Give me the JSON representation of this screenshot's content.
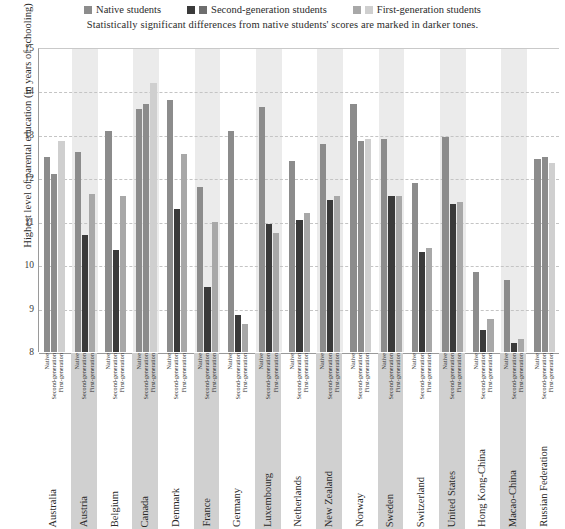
{
  "legend": {
    "items": [
      {
        "label": "Native students",
        "swatches": [
          "#8c8c8c"
        ]
      },
      {
        "label": "Second-generation students",
        "swatches": [
          "#3a3a3a",
          "#6e6e6e"
        ]
      },
      {
        "label": "First-generation students",
        "swatches": [
          "#a8a8a8",
          "#cfcfcf"
        ]
      }
    ]
  },
  "subtitle": "Statistically significant differences from native students' scores are marked in darker tones.",
  "colors": {
    "native": "#8c8c8c",
    "second_sig": "#3a3a3a",
    "second_nonsig": "#8c8c8c",
    "first_sig": "#a8a8a8",
    "first_nonsig": "#cfcfcf",
    "band": "#ebebeb",
    "label_band": "#d0d0d0",
    "grid": "#c4c4c4",
    "axis": "#9a9a9a"
  },
  "chart_data": {
    "type": "bar",
    "title": "",
    "subtitle": "Statistically significant differences from native students' scores are marked in darker tones.",
    "xlabel": "",
    "ylabel": "Highest level of parental education (in years of schooling)",
    "ylim": [
      8,
      15
    ],
    "yticks": [
      8,
      9,
      10,
      11,
      12,
      13,
      14,
      15
    ],
    "grid": true,
    "legend_position": "top",
    "series_labels": [
      "Native",
      "Second-generation",
      "First-generation"
    ],
    "categories": [
      "Australia",
      "Austria",
      "Belgium",
      "Canada",
      "Denmark",
      "France",
      "Germany",
      "Luxembourg",
      "Netherlands",
      "New Zealand",
      "Norway",
      "Sweden",
      "Switzerland",
      "United States",
      "Hong Kong-China",
      "Macao-China",
      "Russian Federation"
    ],
    "series": [
      {
        "name": "Native students",
        "values": [
          12.5,
          12.6,
          13.1,
          13.6,
          13.8,
          11.8,
          13.1,
          13.65,
          12.4,
          12.8,
          13.7,
          12.9,
          11.9,
          12.95,
          9.85,
          9.65,
          12.45
        ]
      },
      {
        "name": "Second-generation students",
        "values": [
          12.1,
          10.7,
          10.35,
          13.7,
          11.3,
          9.5,
          8.85,
          10.95,
          11.05,
          11.5,
          12.85,
          11.6,
          10.3,
          11.4,
          8.5,
          8.2,
          12.5
        ],
        "significant": [
          false,
          true,
          true,
          false,
          true,
          true,
          true,
          true,
          true,
          true,
          false,
          true,
          true,
          true,
          true,
          true,
          false
        ]
      },
      {
        "name": "First-generation students",
        "values": [
          12.85,
          11.65,
          11.6,
          14.2,
          12.55,
          11.0,
          8.65,
          10.75,
          11.2,
          11.6,
          12.9,
          11.6,
          10.4,
          11.45,
          8.75,
          8.3,
          12.35
        ],
        "significant": [
          false,
          true,
          true,
          false,
          true,
          true,
          true,
          true,
          true,
          true,
          false,
          true,
          true,
          true,
          true,
          true,
          false
        ]
      }
    ],
    "highlighted_categories": [
      "Austria",
      "Canada",
      "France",
      "Luxembourg",
      "New Zealand",
      "Sweden",
      "United States",
      "Macao-China"
    ]
  }
}
